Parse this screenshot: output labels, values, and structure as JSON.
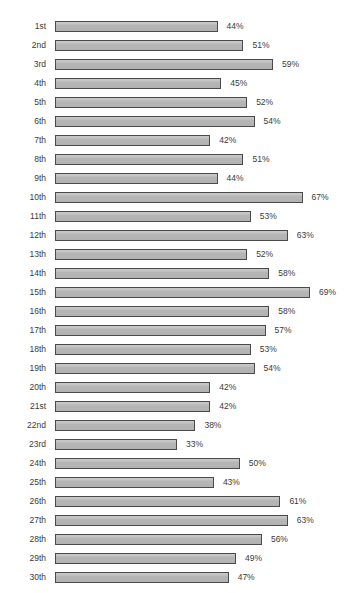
{
  "chart_data": {
    "type": "bar",
    "orientation": "horizontal",
    "title": "",
    "xlabel": "",
    "ylabel": "",
    "xlim": [
      0,
      75
    ],
    "grid": false,
    "legend": null,
    "value_suffix": "%",
    "bar_color": "#b8b8b8",
    "bar_border_color": "#4a4a4a",
    "text_color": "#3a3a3a",
    "background_color": "#ffffff",
    "categories": [
      "1st",
      "2nd",
      "3rd",
      "4th",
      "5th",
      "6th",
      "7th",
      "8th",
      "9th",
      "10th",
      "11th",
      "12th",
      "13th",
      "14th",
      "15th",
      "16th",
      "17th",
      "18th",
      "19th",
      "20th",
      "21st",
      "22nd",
      "23rd",
      "24th",
      "25th",
      "26th",
      "27th",
      "28th",
      "29th",
      "30th"
    ],
    "values": [
      44,
      51,
      59,
      45,
      52,
      54,
      42,
      51,
      44,
      67,
      53,
      63,
      52,
      58,
      69,
      58,
      57,
      53,
      54,
      42,
      42,
      38,
      33,
      50,
      43,
      61,
      63,
      56,
      49,
      47
    ],
    "value_labels": [
      "44%",
      "51%",
      "59%",
      "45%",
      "52%",
      "54%",
      "42%",
      "51%",
      "44%",
      "67%",
      "53%",
      "63%",
      "52%",
      "58%",
      "69%",
      "58%",
      "57%",
      "53%",
      "54%",
      "42%",
      "42%",
      "38%",
      "33%",
      "50%",
      "43%",
      "61%",
      "63%",
      "56%",
      "49%",
      "47%"
    ]
  }
}
